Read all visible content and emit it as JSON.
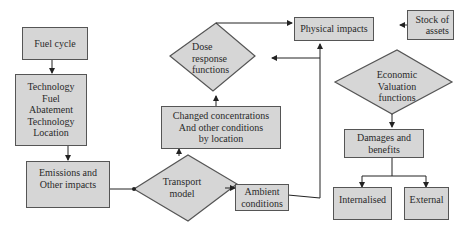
{
  "diagram": {
    "nodes": {
      "fuel_cycle": "Fuel cycle",
      "technology": "Technology\nFuel\nAbatement\nTechnology\nLocation",
      "emissions": "Emissions and\nOther impacts",
      "transport_model": "Transport\nmodel",
      "ambient_conditions": "Ambient\nconditions",
      "changed_concentrations": "Changed concentrations\nAnd other conditions\nby location",
      "dose_response": "Dose\nresponse\nfunctions",
      "physical_impacts": "Physical impacts",
      "stock_of_assets": "Stock of\nassets",
      "economic_valuation": "Economic\nValuation\nfunctions",
      "damages_benefits": "Damages and\nbenefits",
      "internalised": "Internalised",
      "external": "External"
    },
    "colors": {
      "fill": "#d6d6d6",
      "stroke": "#555555",
      "background": "#ffffff"
    }
  }
}
